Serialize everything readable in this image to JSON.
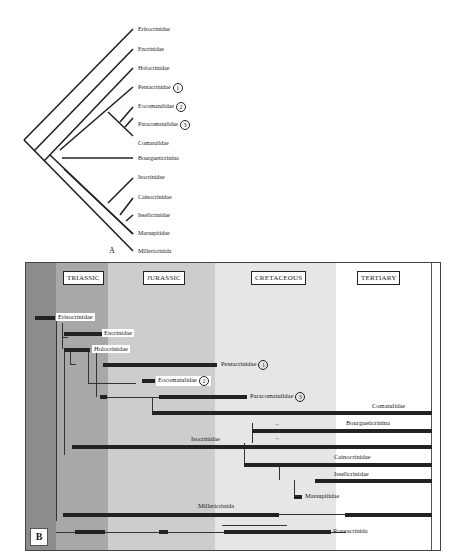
{
  "panel_a": {
    "letter": "A",
    "taxa": [
      {
        "name": "Encrinidae",
        "label": "Encrinidae",
        "marker": null
      },
      {
        "name": "Erisocrinidae",
        "label": "Erisocrinidae",
        "marker": null
      },
      {
        "name": "Holocrinidae",
        "label": "Holocrinidae",
        "marker": null
      },
      {
        "name": "Pentacrinidae",
        "label": "Pentacrinidae",
        "marker": "1"
      },
      {
        "name": "Eocomatulidae",
        "label": "Eocomatulidae",
        "marker": "2"
      },
      {
        "name": "Paracomatulidae",
        "label": "Paracomatulidae",
        "marker": "3"
      },
      {
        "name": "Comatulidae",
        "label": "Comatulidae",
        "marker": null
      },
      {
        "name": "Bourgueticrinina",
        "label": "Bourgueticrinina",
        "marker": null
      },
      {
        "name": "Isocrinidae",
        "label": "Isocrinidae",
        "marker": null
      },
      {
        "name": "Cainocrinidae",
        "label": "Cainocrinidae",
        "marker": null
      },
      {
        "name": "Isselicrinidae",
        "label": "Isselicrinidae",
        "marker": null
      },
      {
        "name": "Marsupitidae",
        "label": "Marsupitidae",
        "marker": null
      },
      {
        "name": "Millericrinida",
        "label": "Millericrinida",
        "marker": null
      }
    ]
  },
  "panel_b": {
    "letter": "B",
    "periods": [
      {
        "label": "TRIASSIC"
      },
      {
        "label": "JURASSIC"
      },
      {
        "label": "CRETACEOUS"
      },
      {
        "label": "TERTIARY"
      }
    ],
    "lineages": {
      "erisocrinidae": "Erisocrinidae",
      "encrinidae": "Encrinidae",
      "holocrinidae": "Holocrinidae",
      "pentacrinidae": "Pentacrinidae",
      "pentacrinidae_marker": "1",
      "eocomatulidae": "Eocomatulidae",
      "eocomatulidae_marker": "2",
      "paracomatulidae": "Paracomatulidae",
      "paracomatulidae_marker": "3",
      "comatulidae": "Comatulidae",
      "bourgueticrinina": "Bourgueticrinina",
      "isocrinidae": "Isocrinidae",
      "cainocrinidae": "Cainocrinidae",
      "isselicrinidae": "Isselicrinidae",
      "marsupitidae": "Marsupitidae",
      "millericrinida": "Millericrinida",
      "roveacrinida": "Roveacrinida"
    },
    "colors": {
      "band_darkest": "#8c8c8c",
      "band_dark": "#a8a8a8",
      "band_medium": "#cdcdcd",
      "band_light": "#e6e6e6",
      "band_white": "#ffffff",
      "bar": "#222222"
    }
  }
}
